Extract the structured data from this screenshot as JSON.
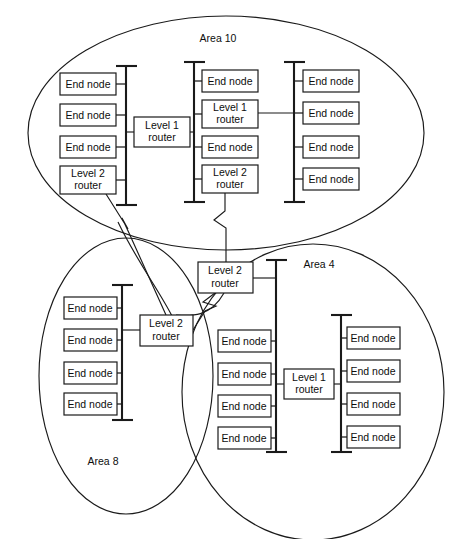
{
  "diagram": {
    "canvas": {
      "width": 452,
      "height": 539
    },
    "colors": {
      "stroke": "#1a1a1a",
      "background": "#ffffff",
      "text": "#0d0d0d"
    },
    "labels": {
      "end_node": "End node",
      "level1_router_line1": "Level 1",
      "level1_router_line2": "router",
      "level2_router_line1": "Level 2",
      "level2_router_line2": "router"
    },
    "areas": [
      {
        "id": "area-10",
        "label": "Area 10",
        "label_x": 218,
        "label_y": 39,
        "cx": 226,
        "cy": 133,
        "rx": 198,
        "ry": 117
      },
      {
        "id": "area-8",
        "label": "Area 8",
        "label_x": 103,
        "label_y": 462,
        "cx": 126,
        "cy": 376,
        "rx": 87,
        "ry": 138
      },
      {
        "id": "area-4",
        "label": "Area 4",
        "label_x": 319,
        "label_y": 265,
        "cx": 313,
        "cy": 392,
        "rx": 131,
        "ry": 148
      }
    ],
    "buses": [
      {
        "id": "bus-area10-left",
        "x": 126,
        "y1": 66,
        "y2": 205
      },
      {
        "id": "bus-area10-middle",
        "x": 194,
        "y1": 62,
        "y2": 202
      },
      {
        "id": "bus-area10-right",
        "x": 294,
        "y1": 62,
        "y2": 202
      },
      {
        "id": "bus-area8",
        "x": 122,
        "y1": 285,
        "y2": 420
      },
      {
        "id": "bus-area4-left",
        "x": 276,
        "y1": 260,
        "y2": 452
      },
      {
        "id": "bus-area4-right",
        "x": 341,
        "y1": 315,
        "y2": 452
      }
    ],
    "nodes": [
      {
        "id": "a10-l-n1",
        "type": "end-node",
        "x": 60,
        "y": 73,
        "w": 56,
        "h": 22,
        "bus": "bus-area10-left",
        "side": "right"
      },
      {
        "id": "a10-l-n2",
        "type": "end-node",
        "x": 60,
        "y": 104,
        "w": 56,
        "h": 22,
        "bus": "bus-area10-left",
        "side": "right"
      },
      {
        "id": "a10-l-n3",
        "type": "end-node",
        "x": 60,
        "y": 136,
        "w": 56,
        "h": 22,
        "bus": "bus-area10-left",
        "side": "right"
      },
      {
        "id": "a10-l-r2",
        "type": "level2-router",
        "x": 60,
        "y": 166,
        "w": 56,
        "h": 28,
        "bus": "bus-area10-left",
        "side": "right"
      },
      {
        "id": "a10-m-n1",
        "type": "end-node",
        "x": 202,
        "y": 70,
        "w": 56,
        "h": 22,
        "bus": "bus-area10-middle",
        "side": "left"
      },
      {
        "id": "a10-m-r1",
        "type": "level1-router",
        "x": 202,
        "y": 100,
        "w": 56,
        "h": 28,
        "bus": "bus-area10-middle",
        "side": "left"
      },
      {
        "id": "a10-m-n2",
        "type": "end-node",
        "x": 202,
        "y": 136,
        "w": 56,
        "h": 22,
        "bus": "bus-area10-middle",
        "side": "left"
      },
      {
        "id": "a10-m-r2",
        "type": "level2-router",
        "x": 202,
        "y": 165,
        "w": 56,
        "h": 28,
        "bus": "bus-area10-middle",
        "side": "left"
      },
      {
        "id": "a10-r-n1",
        "type": "end-node",
        "x": 303,
        "y": 70,
        "w": 56,
        "h": 22,
        "bus": "bus-area10-right",
        "side": "left"
      },
      {
        "id": "a10-r-n2",
        "type": "end-node",
        "x": 303,
        "y": 102,
        "w": 56,
        "h": 22,
        "bus": "bus-area10-right",
        "side": "left"
      },
      {
        "id": "a10-r-n3",
        "type": "end-node",
        "x": 303,
        "y": 136,
        "w": 56,
        "h": 22,
        "bus": "bus-area10-right",
        "side": "left"
      },
      {
        "id": "a10-r-n4",
        "type": "end-node",
        "x": 303,
        "y": 168,
        "w": 56,
        "h": 22,
        "bus": "bus-area10-right",
        "side": "left"
      },
      {
        "id": "a10-center-r1",
        "type": "level1-router",
        "x": 134,
        "y": 117,
        "w": 56,
        "h": 30,
        "bus": null,
        "side": "none"
      },
      {
        "id": "backbone-r2",
        "type": "level2-router",
        "x": 198,
        "y": 262,
        "w": 55,
        "h": 31,
        "bus": null,
        "side": "none"
      },
      {
        "id": "a8-n1",
        "type": "end-node",
        "x": 64,
        "y": 297,
        "w": 53,
        "h": 22,
        "bus": "bus-area8",
        "side": "right"
      },
      {
        "id": "a8-n2",
        "type": "end-node",
        "x": 64,
        "y": 329,
        "w": 53,
        "h": 22,
        "bus": "bus-area8",
        "side": "right"
      },
      {
        "id": "a8-n3",
        "type": "end-node",
        "x": 64,
        "y": 362,
        "w": 53,
        "h": 22,
        "bus": "bus-area8",
        "side": "right"
      },
      {
        "id": "a8-n4",
        "type": "end-node",
        "x": 64,
        "y": 393,
        "w": 53,
        "h": 22,
        "bus": "bus-area8",
        "side": "right"
      },
      {
        "id": "a8-r2",
        "type": "level2-router",
        "x": 140,
        "y": 315,
        "w": 53,
        "h": 31,
        "bus": "bus-area8",
        "side": "left-stub"
      },
      {
        "id": "a4-l-n1",
        "type": "end-node",
        "x": 218,
        "y": 330,
        "w": 53,
        "h": 22,
        "bus": "bus-area4-left",
        "side": "right"
      },
      {
        "id": "a4-l-n2",
        "type": "end-node",
        "x": 218,
        "y": 363,
        "w": 53,
        "h": 22,
        "bus": "bus-area4-left",
        "side": "right"
      },
      {
        "id": "a4-l-n3",
        "type": "end-node",
        "x": 218,
        "y": 395,
        "w": 53,
        "h": 22,
        "bus": "bus-area4-left",
        "side": "right"
      },
      {
        "id": "a4-l-n4",
        "type": "end-node",
        "x": 218,
        "y": 427,
        "w": 53,
        "h": 22,
        "bus": "bus-area4-left",
        "side": "right"
      },
      {
        "id": "a4-center-r1",
        "type": "level1-router",
        "x": 284,
        "y": 369,
        "w": 50,
        "h": 30,
        "bus": null,
        "side": "none"
      },
      {
        "id": "a4-r-n1",
        "type": "end-node",
        "x": 347,
        "y": 327,
        "w": 53,
        "h": 22,
        "bus": "bus-area4-right",
        "side": "left"
      },
      {
        "id": "a4-r-n2",
        "type": "end-node",
        "x": 347,
        "y": 360,
        "w": 53,
        "h": 22,
        "bus": "bus-area4-right",
        "side": "left"
      },
      {
        "id": "a4-r-n3",
        "type": "end-node",
        "x": 347,
        "y": 393,
        "w": 53,
        "h": 22,
        "bus": "bus-area4-right",
        "side": "left"
      },
      {
        "id": "a4-r-n4",
        "type": "end-node",
        "x": 347,
        "y": 426,
        "w": 53,
        "h": 22,
        "bus": "bus-area4-right",
        "side": "left"
      }
    ],
    "links": [
      {
        "id": "link-a10-left-bus-to-center-r1",
        "from": "bus-area10-left",
        "to": "a10-center-r1",
        "kind": "straight"
      },
      {
        "id": "link-center-r1-to-middle-bus",
        "from": "a10-center-r1",
        "to": "bus-area10-middle",
        "kind": "straight"
      },
      {
        "id": "link-a10-m-r1-to-right-bus",
        "from": "a10-m-r1",
        "to": "bus-area10-right",
        "kind": "straight"
      },
      {
        "id": "link-a10-m-r2-to-backbone",
        "from": "a10-m-r2",
        "to": "backbone-r2",
        "kind": "zigzag-vertical"
      },
      {
        "id": "link-a10-l-r2-to-a8-r2",
        "from": "a10-l-r2",
        "to": "a8-r2",
        "kind": "zigzag-diagonal"
      },
      {
        "id": "link-backbone-to-a8-r2",
        "from": "backbone-r2",
        "to": "a8-r2",
        "kind": "zigzag-diagonal"
      },
      {
        "id": "link-backbone-to-a4-bus",
        "from": "backbone-r2",
        "to": "bus-area4-left",
        "kind": "straight"
      },
      {
        "id": "link-a4-left-bus-to-r1",
        "from": "bus-area4-left",
        "to": "a4-center-r1",
        "kind": "straight"
      },
      {
        "id": "link-a4-r1-to-right-bus",
        "from": "a4-center-r1",
        "to": "bus-area4-right",
        "kind": "straight"
      }
    ]
  }
}
